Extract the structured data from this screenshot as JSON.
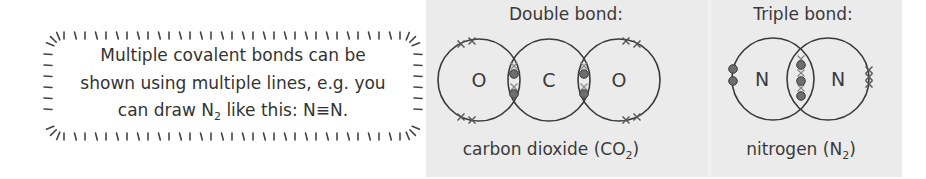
{
  "callout": {
    "line1": "Multiple covalent bonds can be",
    "line2": "shown using multiple lines, e.g. you",
    "line3_prefix": "can draw N",
    "line3_sub": "2",
    "line3_suffix": " like this: N≡N."
  },
  "double_bond": {
    "heading": "Double bond:",
    "atoms": [
      "O",
      "C",
      "O"
    ],
    "caption_prefix": "carbon dioxide (CO",
    "caption_sub": "2",
    "caption_suffix": ")"
  },
  "triple_bond": {
    "heading": "Triple bond:",
    "atoms": [
      "N",
      "N"
    ],
    "caption_prefix": "nitrogen (N",
    "caption_sub": "2",
    "caption_suffix": ")"
  },
  "colors": {
    "panel_bg": "#ebebeb",
    "line": "#3a3a3a",
    "dot_electron": "#6e6e6e",
    "cross_electron": "#555555"
  }
}
